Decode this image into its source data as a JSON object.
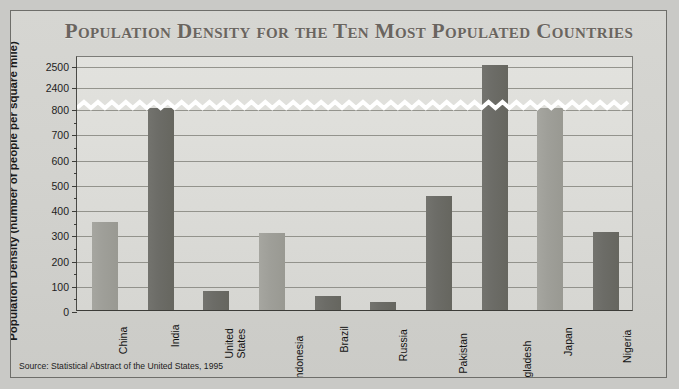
{
  "chart_data": {
    "type": "bar",
    "title": "Population Density for the Ten Most Populated Countries",
    "xlabel": "Country",
    "ylabel": "Population Density (number of people per square mile)",
    "source": "Source: Statistical Abstract of the United States, 1995",
    "categories": [
      "China",
      "India",
      "United States",
      "Indonesia",
      "Brazil",
      "Russia",
      "Pakistan",
      "Bangladesh",
      "Japan",
      "Nigeria"
    ],
    "category_lines": [
      [
        "China"
      ],
      [
        "India"
      ],
      [
        "United",
        "States"
      ],
      [
        "Indonesia"
      ],
      [
        "Brazil"
      ],
      [
        "Russia"
      ],
      [
        "Pakistan"
      ],
      [
        "Bangladesh"
      ],
      [
        "Japan"
      ],
      [
        "Nigeria"
      ]
    ],
    "values": [
      350,
      800,
      75,
      305,
      55,
      30,
      450,
      2500,
      810,
      310
    ],
    "bar_shades": [
      "light",
      "dark",
      "dark",
      "light",
      "dark",
      "dark",
      "dark",
      "dark",
      "light",
      "dark"
    ],
    "ytick_labels": [
      "2500",
      "2400",
      "800",
      "700",
      "600",
      "500",
      "400",
      "300",
      "200",
      "100",
      "0"
    ],
    "ytick_values": [
      2500,
      2400,
      800,
      700,
      600,
      500,
      400,
      300,
      200,
      100,
      0
    ],
    "ylim": [
      0,
      2500
    ],
    "axis_break": true,
    "axis_break_between": [
      800,
      2400
    ],
    "grid": true,
    "legend": "none",
    "colors": {
      "bar_dark": "#6c6c67",
      "bar_light": "#9f9f99",
      "plot_background": "#dcdcd8",
      "figure_background": "#d2d2ce",
      "title_color": "#6a655f",
      "axis_color": "#3c3c38",
      "grid_color": "#86867f"
    }
  }
}
